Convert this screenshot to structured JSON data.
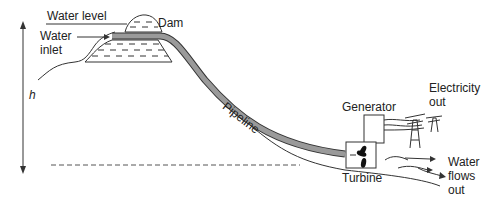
{
  "diagram": {
    "labels": {
      "water_level": "Water level",
      "dam": "Dam",
      "water_inlet_line1": "Water",
      "water_inlet_line2": "inlet",
      "height": "h",
      "pipeline": "Pipeline",
      "generator": "Generator",
      "electricity_line1": "Electricity",
      "electricity_line2": "out",
      "turbine": "Turbine",
      "water_out_line1": "Water",
      "water_out_line2": "flows",
      "water_out_line3": "out"
    },
    "colors": {
      "line": "#333333",
      "pipe_fill": "#9a9a9a",
      "background": "#ffffff"
    }
  }
}
